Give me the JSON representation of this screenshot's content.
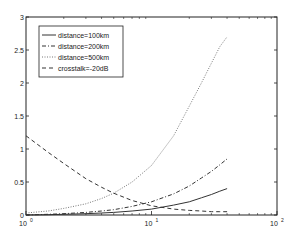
{
  "chart_data": {
    "type": "line",
    "title": "",
    "xlabel": "",
    "ylabel": "",
    "xscale": "log",
    "xlim": [
      1,
      100
    ],
    "ylim": [
      0,
      3
    ],
    "grid": false,
    "legend_position": "upper left",
    "x_ticks": [
      {
        "value": 1,
        "label_base": "10",
        "label_exp": "0"
      },
      {
        "value": 10,
        "label_base": "10",
        "label_exp": "1"
      },
      {
        "value": 100,
        "label_base": "10",
        "label_exp": "2"
      }
    ],
    "y_ticks": [
      {
        "value": 0,
        "label": "0"
      },
      {
        "value": 0.5,
        "label": "0.5"
      },
      {
        "value": 1,
        "label": "1"
      },
      {
        "value": 1.5,
        "label": "1.5"
      },
      {
        "value": 2,
        "label": "2"
      },
      {
        "value": 2.5,
        "label": "2.5"
      },
      {
        "value": 3,
        "label": "3"
      }
    ],
    "x": [
      1,
      1.5,
      2,
      3,
      4,
      5,
      7,
      10,
      15,
      20,
      25,
      30,
      35,
      40
    ],
    "series": [
      {
        "name": "distance=100km",
        "style": "solid",
        "values": [
          0.0,
          0.005,
          0.01,
          0.02,
          0.03,
          0.04,
          0.06,
          0.09,
          0.15,
          0.2,
          0.26,
          0.31,
          0.36,
          0.4
        ]
      },
      {
        "name": "distance=200km",
        "style": "dashdot",
        "values": [
          0.0,
          0.01,
          0.02,
          0.04,
          0.06,
          0.08,
          0.13,
          0.2,
          0.32,
          0.44,
          0.56,
          0.66,
          0.76,
          0.85
        ]
      },
      {
        "name": "distance=500km",
        "style": "dotted",
        "values": [
          0.03,
          0.06,
          0.1,
          0.17,
          0.25,
          0.33,
          0.5,
          0.75,
          1.2,
          1.65,
          2.0,
          2.3,
          2.55,
          2.7
        ]
      },
      {
        "name": "crosstalk=-20dB",
        "style": "dashed",
        "values": [
          1.2,
          0.95,
          0.78,
          0.55,
          0.42,
          0.33,
          0.22,
          0.14,
          0.09,
          0.07,
          0.06,
          0.05,
          0.05,
          0.05
        ]
      }
    ]
  },
  "legend": {
    "items": [
      {
        "label": "distance=100km",
        "style": "solid"
      },
      {
        "label": "distance=200km",
        "style": "dashdot"
      },
      {
        "label": "distance=500km",
        "style": "dotted"
      },
      {
        "label": "crosstalk=-20dB",
        "style": "dashed"
      }
    ]
  },
  "colors": {
    "axis": "#222222",
    "line": "#333333",
    "background": "#ffffff"
  }
}
